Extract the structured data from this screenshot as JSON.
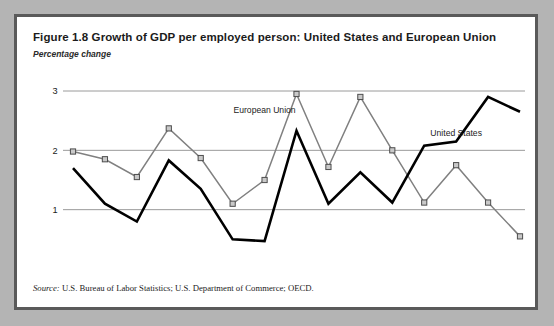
{
  "figure": {
    "title": "Figure 1.8  Growth of GDP per employed person: United States and European Union",
    "subtitle": "Percentage change",
    "source_label": "Source:",
    "source_text": " U.S. Bureau of Labor Statistics; U.S. Department of Commerce; OECD."
  },
  "chart_data": {
    "type": "line",
    "title": "Growth of GDP per employed person: United States and European Union",
    "subtitle": "Percentage change",
    "xlabel": "",
    "ylabel": "Percentage change",
    "ylim": [
      0,
      3
    ],
    "yticks": [
      "0",
      "1",
      "2",
      "3"
    ],
    "ytick_values": [
      0,
      1,
      2,
      3
    ],
    "grid": "horizontal",
    "legend_position": "inline-annotations",
    "categories": [
      "1985",
      "1986",
      "1987",
      "1988",
      "1989",
      "1990",
      "1991",
      "1992",
      "1993",
      "1994",
      "1995",
      "1996",
      "1997",
      "1998",
      "1999"
    ],
    "series": [
      {
        "name": "European Union",
        "color": "#808080",
        "marker": "square",
        "values": [
          1.98,
          1.85,
          1.55,
          2.37,
          1.87,
          1.1,
          1.5,
          2.95,
          1.72,
          2.9,
          2.0,
          1.12,
          1.75,
          1.12,
          0.55
        ]
      },
      {
        "name": "United States",
        "color": "#000000",
        "marker": "none",
        "values": [
          1.7,
          1.1,
          0.8,
          1.83,
          1.35,
          0.5,
          0.47,
          2.33,
          1.1,
          1.63,
          1.12,
          2.08,
          2.15,
          2.9,
          2.65
        ]
      }
    ],
    "annotations": [
      {
        "text": "European Union",
        "x": 1991,
        "y": 2.63
      },
      {
        "text": "United States",
        "x": 1997,
        "y": 2.25
      }
    ]
  },
  "colors": {
    "eu_line": "#808080",
    "us_line": "#000000",
    "gridline": "#9a9a9a",
    "frame": "#5a5a5a",
    "page_background": "#b4b4b4",
    "figure_background": "#ffffff"
  }
}
